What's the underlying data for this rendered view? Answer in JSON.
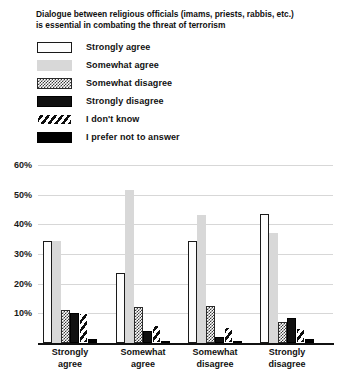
{
  "chart_data": {
    "type": "bar",
    "title": "Dialogue between religious officials (imams, priests, rabbis, etc.) is essential in combating the threat of terrorism",
    "title_lines": [
      "Dialogue between religious officials (imams, priests, rabbis, etc.)",
      "is essential in combating the threat of terrorism"
    ],
    "xlabel": "",
    "ylabel": "",
    "ylim": [
      0,
      60
    ],
    "grid": true,
    "legend_position": "top",
    "categories": [
      "Strongly agree",
      "Somewhat agree",
      "Somewhat disagree",
      "Strongly disagree"
    ],
    "category_lines": [
      [
        "Strongly",
        "agree"
      ],
      [
        "Somewhat",
        "agree"
      ],
      [
        "Somewhat",
        "disagree"
      ],
      [
        "Strongly",
        "disagree"
      ]
    ],
    "y_ticks": [
      "60%",
      "50%",
      "40%",
      "30%",
      "20%",
      "10%"
    ],
    "y_tick_values": [
      60,
      50,
      40,
      30,
      20,
      10
    ],
    "series": [
      {
        "name": "Strongly agree",
        "pattern": "white-outline",
        "values": [
          34.5,
          23.5,
          34.5,
          43.5
        ]
      },
      {
        "name": "Somewhat agree",
        "pattern": "light-gray",
        "values": [
          34.5,
          51.5,
          43.0,
          37.0
        ]
      },
      {
        "name": "Somewhat disagree",
        "pattern": "checkered-gray",
        "values": [
          11.0,
          12.0,
          12.5,
          7.0
        ]
      },
      {
        "name": "Strongly disagree",
        "pattern": "black-outline",
        "values": [
          10.0,
          4.0,
          2.0,
          8.5
        ]
      },
      {
        "name": "I don't know",
        "pattern": "diagonal-hatch",
        "values": [
          10.0,
          6.0,
          5.5,
          5.0
        ]
      },
      {
        "name": "I prefer not to answer",
        "pattern": "solid-black",
        "values": [
          1.5,
          0.8,
          0.8,
          1.5
        ]
      }
    ]
  },
  "legend": {
    "items": [
      {
        "label": "Strongly agree",
        "swatch": "strongly-agree-swatch"
      },
      {
        "label": "Somewhat agree",
        "swatch": "somewhat-agree-swatch"
      },
      {
        "label": "Somewhat disagree",
        "swatch": "somewhat-disagree-swatch"
      },
      {
        "label": "Strongly disagree",
        "swatch": "strongly-disagree-swatch"
      },
      {
        "label": "I don't know",
        "swatch": "dont-know-swatch"
      },
      {
        "label": "I prefer not to answer",
        "swatch": "prefer-not-to-answer-swatch"
      }
    ]
  },
  "colors": {
    "text": "#111111",
    "gridline": "#d7d7d7",
    "axis": "#111111",
    "light_gray_fill": "#d8d8d8",
    "black_fill": "#000000",
    "background": "#ffffff"
  }
}
